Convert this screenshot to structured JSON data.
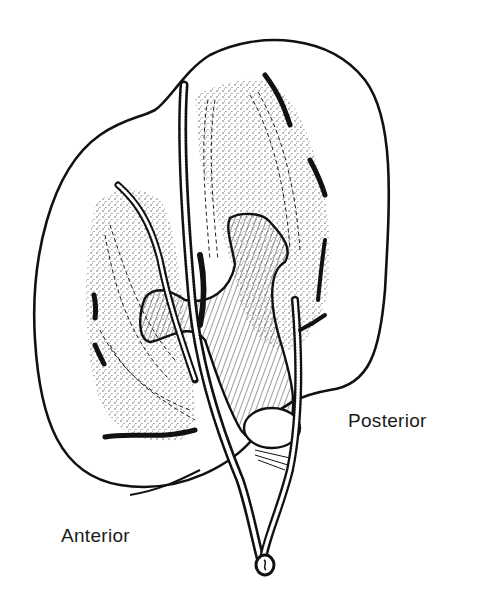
{
  "figure": {
    "labels": {
      "posterior": "Posterior",
      "anterior": "Anterior"
    },
    "colors": {
      "ink": "#111111",
      "background": "#ffffff",
      "stipple": "#333333"
    }
  }
}
